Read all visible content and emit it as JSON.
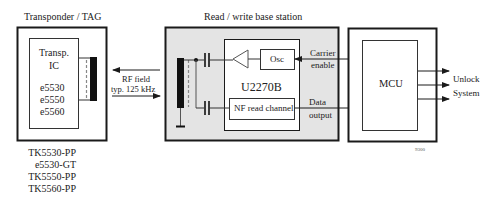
{
  "transponder": {
    "title": "Transponder / TAG",
    "ic_label_1": "Transp.",
    "ic_label_2": "IC",
    "ic_parts": [
      "e5530",
      "e5550",
      "e5560"
    ],
    "part_numbers": [
      "TK5530-PP",
      "e5530-GT",
      "TK5550-PP",
      "TK5560-PP"
    ]
  },
  "rf_link": {
    "label_1": "RF field",
    "label_2": "typ. 125 kHz"
  },
  "base_station": {
    "title": "Read / write base station",
    "chip_label": "U2270B",
    "osc_label": "Osc",
    "nf_label": "NF read channel",
    "carrier_label_1": "Carrier",
    "carrier_label_2": "enable",
    "data_label_1": "Data",
    "data_label_2": "output"
  },
  "mcu": {
    "label": "MCU",
    "output_label_1": "Unlock",
    "output_label_2": "System"
  },
  "figure_id": "9300",
  "colors": {
    "line": "#1a1a1a",
    "base_fill": "#e4e4e4",
    "white": "#ffffff"
  }
}
